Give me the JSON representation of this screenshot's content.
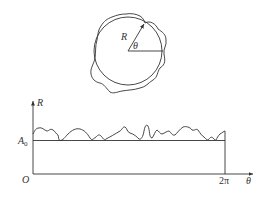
{
  "top_figure": {
    "description": "Circle with irregular roundness profile overlaid; radius vector R at angle theta",
    "labels": {
      "radius": "R",
      "angle": "θ"
    }
  },
  "bottom_figure": {
    "description": "Unrolled roundness profile R versus theta from 0 to 2π above baseline A0",
    "labels": {
      "y_axis": "R",
      "x_axis": "θ",
      "origin": "O",
      "baseline_main": "A",
      "baseline_sub": "0",
      "x_end": "2π"
    }
  }
}
